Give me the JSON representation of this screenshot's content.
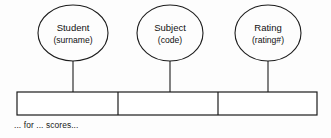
{
  "diagram": {
    "type": "orm-fact-type-diagram",
    "caption": "... for ... scores...",
    "stroke_color": "#1c1c1c",
    "background_color": "#fdfdfd",
    "entities": [
      {
        "name": "Student",
        "reference_mode": "(surname)",
        "cx": 73,
        "cy": 33,
        "rx": 35,
        "ry": 28
      },
      {
        "name": "Subject",
        "reference_mode": "(code)",
        "cx": 170,
        "cy": 33,
        "rx": 33,
        "ry": 28
      },
      {
        "name": "Rating",
        "reference_mode": "(rating#)",
        "cx": 268,
        "cy": 33,
        "rx": 33,
        "ry": 28
      }
    ],
    "fact_box": {
      "x": 17,
      "y": 92,
      "width": 300,
      "height": 23,
      "role_count": 3,
      "divider_positions": [
        118,
        218
      ]
    },
    "connectors": [
      {
        "x": 73,
        "y1": 61,
        "y2": 92
      },
      {
        "x": 170,
        "y1": 61,
        "y2": 92
      },
      {
        "x": 268,
        "y1": 61,
        "y2": 92
      }
    ]
  }
}
